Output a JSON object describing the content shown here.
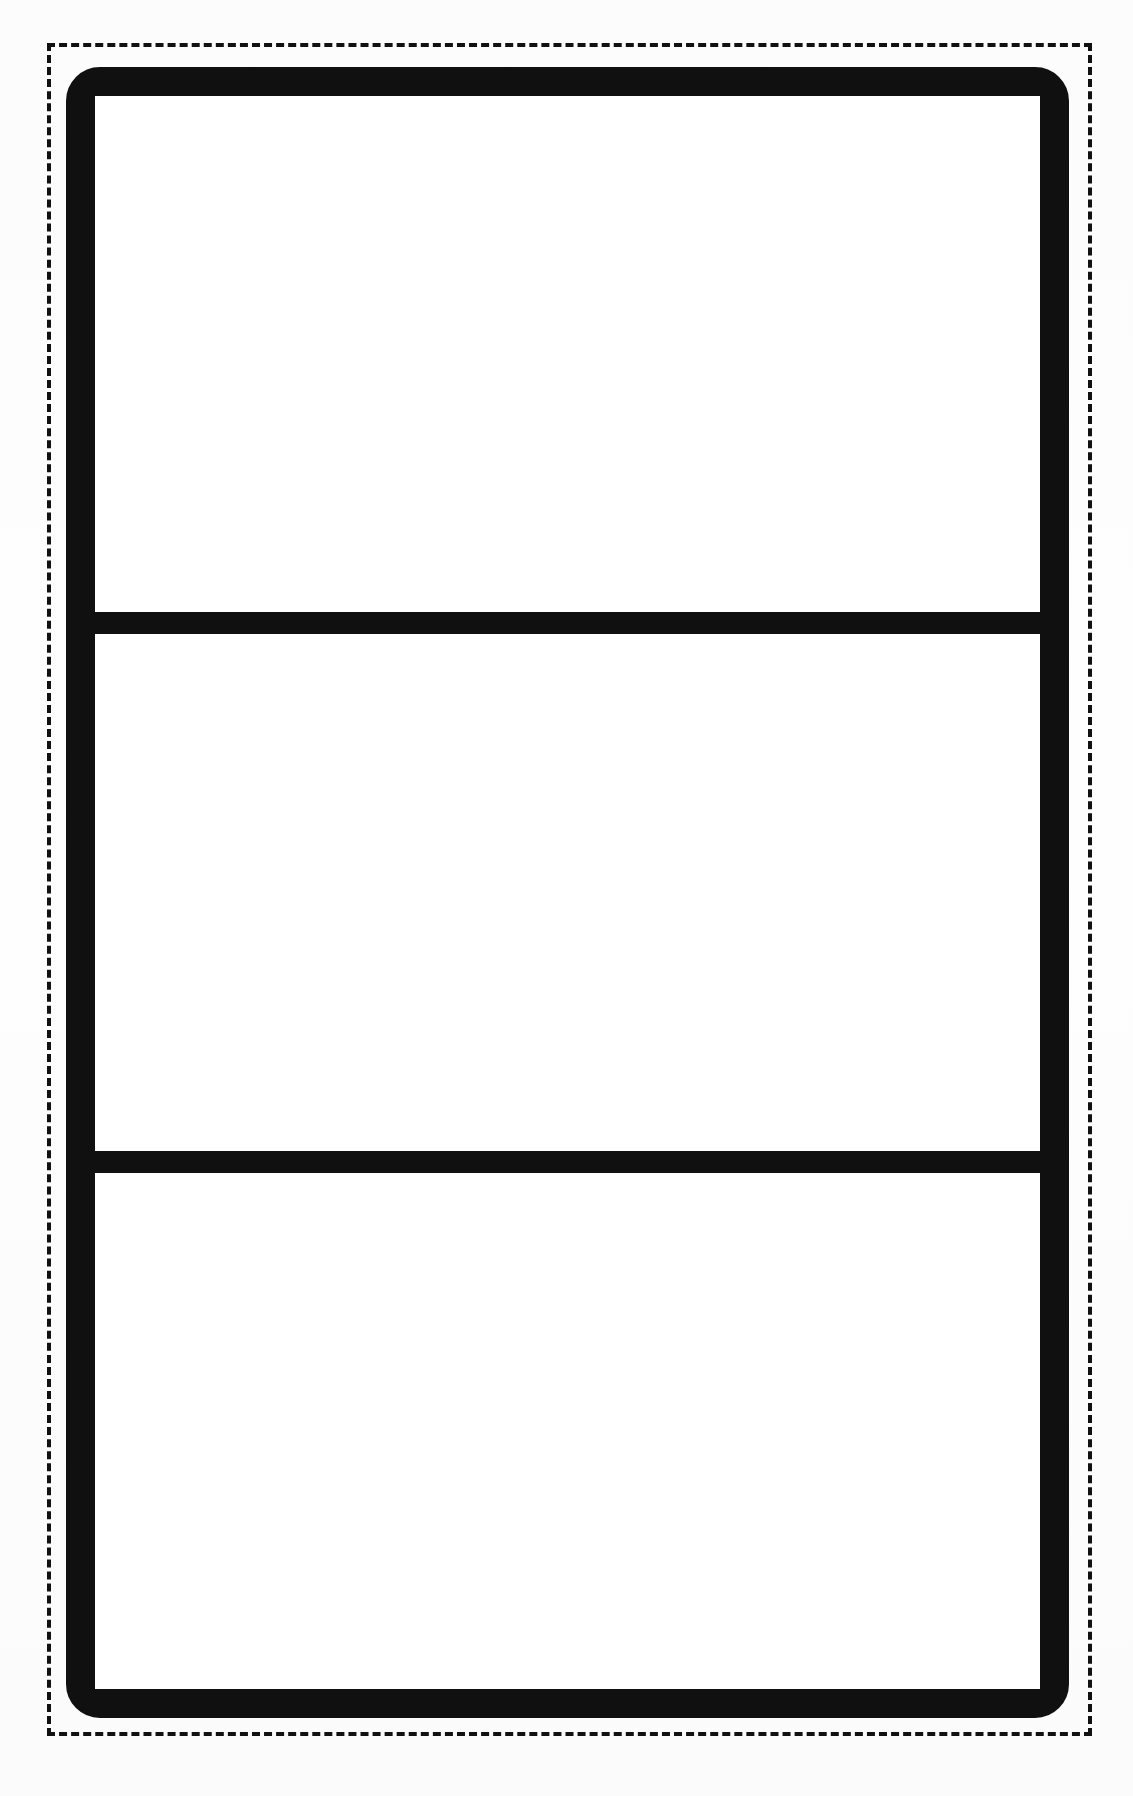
{
  "document": {
    "type": "blank-printable-template",
    "orientation": "portrait",
    "background_color": "#fdfdfd"
  },
  "cut_guide": {
    "name": "cut-line",
    "style": "dashed",
    "color": "#111111",
    "label": ""
  },
  "card": {
    "name": "bordered-card",
    "border_color": "#101010",
    "fill_color": "#ffffff",
    "corner_style": "rounded",
    "divider_color": "#101010",
    "cells": [
      {
        "label": "",
        "name": "cell-top"
      },
      {
        "label": "",
        "name": "cell-middle"
      },
      {
        "label": "",
        "name": "cell-bottom"
      }
    ]
  }
}
